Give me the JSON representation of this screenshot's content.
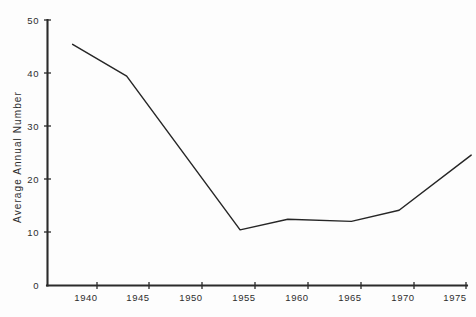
{
  "chart_data": {
    "type": "line",
    "title": "",
    "xlabel": "",
    "ylabel": "Average  Annual  Number",
    "xlim": [
      1937,
      1977
    ],
    "ylim": [
      0,
      50
    ],
    "grid": false,
    "legend": "none",
    "x_ticks": [
      1940,
      1945,
      1950,
      1955,
      1960,
      1965,
      1970,
      1975
    ],
    "x_tick_labels": [
      "1940",
      "1945",
      "1950",
      "1955",
      "1960",
      "1965",
      "1970",
      "1975"
    ],
    "y_ticks": [
      0,
      10,
      20,
      30,
      40,
      50
    ],
    "y_tick_labels": [
      "0",
      "10",
      "20",
      "30",
      "40",
      "50"
    ],
    "series": [
      {
        "name": "Average Annual Number",
        "color": "#262626",
        "x": [
          1937.7,
          1942.8,
          1953.5,
          1958.0,
          1964.0,
          1968.5,
          1975.3
        ],
        "values": [
          45.5,
          39.5,
          10.5,
          12.5,
          12.1,
          14.2,
          24.6
        ]
      }
    ]
  },
  "axes": {
    "y_title": "Average  Annual  Number"
  }
}
